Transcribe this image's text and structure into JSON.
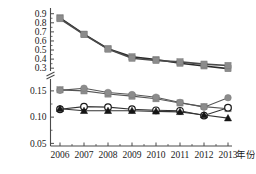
{
  "chart_data": {
    "type": "line",
    "title": "",
    "subtitle": "",
    "xlabel": "年份",
    "ylabel": "",
    "grid": false,
    "legend": "none",
    "broken_axis": true,
    "x": [
      2006,
      2007,
      2008,
      2009,
      2010,
      2011,
      2012,
      2013
    ],
    "categories": [
      "2006",
      "2007",
      "2008",
      "2009",
      "2010",
      "2011",
      "2012",
      "2013"
    ],
    "xtick_labels": [
      "2006",
      "2007",
      "2008",
      "2009",
      "2010",
      "2011",
      "2012",
      "2013"
    ],
    "ytick_labels_upper": [
      "0.9",
      "0.8",
      "0.7",
      "0.6",
      "0.5",
      "0.4",
      "0.3"
    ],
    "ytick_labels_lower": [
      "0.15",
      "0.10",
      "0.05"
    ],
    "ytick_values_upper": [
      0.9,
      0.8,
      0.7,
      0.6,
      0.5,
      0.4,
      0.3
    ],
    "ytick_values_lower": [
      0.15,
      0.1,
      0.05
    ],
    "ylim_upper": [
      0.28,
      0.93
    ],
    "ylim_lower": [
      0.045,
      0.165
    ],
    "colors": {
      "gray_marker": "#8c8c8c",
      "dark_line": "#2b2b2b",
      "mid_line": "#555555",
      "black_marker": "#151515",
      "open_marker_fill": "#ffffff",
      "axis": "#4a4a4a"
    },
    "series": [
      {
        "name": "series-upper-1",
        "marker": "square",
        "marker_color": "#8c8c8c",
        "line_color": "#2b2b2b",
        "panel": "upper",
        "values": [
          0.855,
          0.675,
          0.515,
          0.425,
          0.395,
          0.355,
          0.325,
          0.295
        ]
      },
      {
        "name": "series-upper-2",
        "marker": "square",
        "marker_color": "#8c8c8c",
        "line_color": "#4a4a4a",
        "panel": "upper",
        "values": [
          0.845,
          0.67,
          0.51,
          0.41,
          0.385,
          0.37,
          0.345,
          0.33
        ]
      },
      {
        "name": "series-lower-gray-square",
        "marker": "square",
        "marker_color": "#8c8c8c",
        "line_color": "#555555",
        "panel": "lower",
        "values": [
          0.152,
          0.15,
          0.144,
          0.14,
          0.135,
          0.127,
          0.12,
          0.116
        ]
      },
      {
        "name": "series-lower-gray-circle",
        "marker": "circle-filled",
        "marker_color": "#8c8c8c",
        "line_color": "#555555",
        "panel": "lower",
        "values": [
          0.151,
          0.155,
          0.147,
          0.143,
          0.138,
          0.128,
          0.119,
          0.137
        ]
      },
      {
        "name": "series-lower-open-circle",
        "marker": "circle-open",
        "marker_color": "#1a1a1a",
        "line_color": "#333333",
        "panel": "lower",
        "values": [
          0.115,
          0.12,
          0.119,
          0.115,
          0.113,
          0.112,
          0.103,
          0.118
        ]
      },
      {
        "name": "series-lower-black-triangle",
        "marker": "triangle",
        "marker_color": "#151515",
        "line_color": "#333333",
        "panel": "lower",
        "values": [
          0.116,
          0.112,
          0.112,
          0.112,
          0.111,
          0.11,
          0.104,
          0.098
        ]
      }
    ]
  }
}
